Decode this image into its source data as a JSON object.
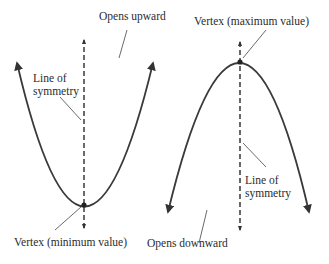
{
  "figure": {
    "colors": {
      "curve": "#3a3a3a",
      "axis": "#2b2b2b",
      "text": "#2b2b2b",
      "background": "#ffffff"
    }
  },
  "left_parabola": {
    "orientation": "opens upward",
    "labels": {
      "opens": "Opens upward",
      "symmetry_line1": "Line of",
      "symmetry_line2": "symmetry",
      "vertex": "Vertex (minimum value)"
    }
  },
  "right_parabola": {
    "orientation": "opens downward",
    "labels": {
      "vertex": "Vertex (maximum value)",
      "symmetry_line1": "Line of",
      "symmetry_line2": "symmetry",
      "opens": "Opens downward"
    }
  }
}
